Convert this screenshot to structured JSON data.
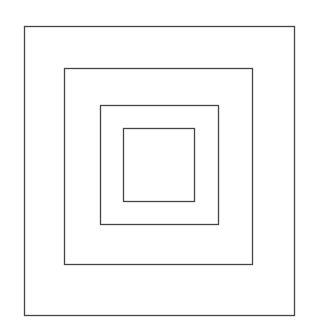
{
  "diagram": {
    "type": "nested-squares",
    "stroke_color": "#444444",
    "background": "#ffffff",
    "squares": [
      {
        "name": "outer",
        "x": 24,
        "y": 26,
        "width": 270,
        "height": 289
      },
      {
        "name": "second",
        "x": 64,
        "y": 68,
        "width": 188,
        "height": 196
      },
      {
        "name": "third",
        "x": 100,
        "y": 105,
        "width": 118,
        "height": 119
      },
      {
        "name": "inner",
        "x": 123,
        "y": 128,
        "width": 71,
        "height": 73
      }
    ]
  }
}
